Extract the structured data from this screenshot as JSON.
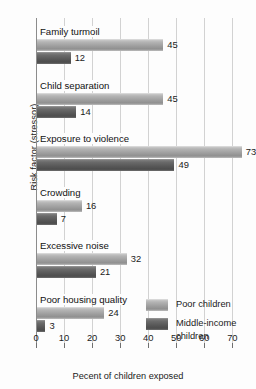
{
  "chart_data": {
    "type": "bar",
    "orientation": "horizontal",
    "title": "",
    "xlabel": "Pecent of children exposed",
    "ylabel": "Risk factor (stressor)",
    "xlim": [
      0,
      77
    ],
    "xticks": [
      0,
      10,
      20,
      30,
      40,
      50,
      60,
      70
    ],
    "xtick_labels": [
      "0",
      "10",
      "20",
      "30",
      "40",
      "50",
      "60",
      "70"
    ],
    "grid": "vertical",
    "legend_position": "bottom-right-inside",
    "categories": [
      "Family turmoil",
      "Child separation",
      "Exposure to violence",
      "Crowding",
      "Excessive noise",
      "Poor housing quality"
    ],
    "series": [
      {
        "name": "Poor children",
        "color": "#a8a8a8",
        "values": [
          45,
          45,
          73,
          16,
          32,
          24
        ],
        "value_labels": [
          "45",
          "45",
          "73",
          "16",
          "32",
          "24"
        ]
      },
      {
        "name": "Middle-income children",
        "color": "#585858",
        "values": [
          12,
          14,
          49,
          7,
          21,
          3
        ],
        "value_labels": [
          "12",
          "14",
          "49",
          "7",
          "21",
          "3"
        ]
      }
    ]
  },
  "legend": {
    "items": [
      {
        "label": "Poor children",
        "swatch": "poor"
      },
      {
        "label": "Middle-income children",
        "swatch": "middle"
      }
    ]
  }
}
